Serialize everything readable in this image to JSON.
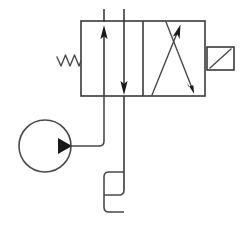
{
  "diagram": {
    "title": "Hydraulic solenoid directional control valve schematic",
    "type": "fluid-power-schematic",
    "background_color": "#ffffff",
    "line_color": "#3a3a3a",
    "fill_color": "#1a1a1a",
    "components": [
      {
        "id": "valve-body",
        "name": "two-position four-way directional valve body",
        "shape": "rectangle",
        "x": 81,
        "y": 21,
        "width": 124,
        "height": 75,
        "divider_x": 143
      },
      {
        "id": "envelope-left",
        "name": "parallel-flow envelope",
        "arrows": [
          {
            "id": "arrow-up-left",
            "x": 104,
            "from_y": 96,
            "to_y": 26,
            "direction": "up"
          },
          {
            "id": "arrow-down-left",
            "x": 124,
            "from_y": 21,
            "to_y": 95,
            "direction": "down"
          }
        ]
      },
      {
        "id": "envelope-right",
        "name": "crossed-flow envelope",
        "crossed_arrows": [
          {
            "id": "arrow-cross-up",
            "x1": 152,
            "y1": 95,
            "x2": 180,
            "y2": 26,
            "direction": "up"
          },
          {
            "id": "arrow-cross-down",
            "x1": 166,
            "y1": 22,
            "x2": 194,
            "y2": 94,
            "direction": "down"
          }
        ]
      },
      {
        "id": "spring-return",
        "name": "return spring actuator",
        "shape": "zigzag",
        "x_start": 57,
        "x_end": 81,
        "y_center": 61,
        "peaks": 3
      },
      {
        "id": "solenoid-actuator",
        "name": "solenoid actuator box",
        "shape": "rectangle-with-diagonal",
        "x": 207,
        "y": 47,
        "width": 27,
        "height": 23,
        "diagonal": "bottom-left-to-top-right"
      },
      {
        "id": "pump",
        "name": "hydraulic pump",
        "shape": "circle-with-triangle",
        "cx": 45,
        "cy": 146,
        "r": 26,
        "triangle_direction": "right"
      },
      {
        "id": "pressure-line",
        "name": "pressure supply line from pump to valve port P",
        "path": "from pump (71,146) right to (104,146) then up to valve bottom (104,96)"
      },
      {
        "id": "tank-line",
        "name": "return line to reservoir",
        "path": "from valve bottom (124,96) down to (124,195)"
      },
      {
        "id": "reservoir",
        "name": "reservoir / tank bracket symbol",
        "x_left": 104,
        "x_right": 124,
        "y_top": 172,
        "y_mid": 195,
        "y_bottom": 212
      }
    ],
    "ports": [
      {
        "id": "port-a",
        "name": "port A top line",
        "x": 104,
        "y_top": 9,
        "y_bottom": 21
      },
      {
        "id": "port-b",
        "name": "port B top line",
        "x": 124,
        "y_top": 9,
        "y_bottom": 21
      }
    ]
  }
}
